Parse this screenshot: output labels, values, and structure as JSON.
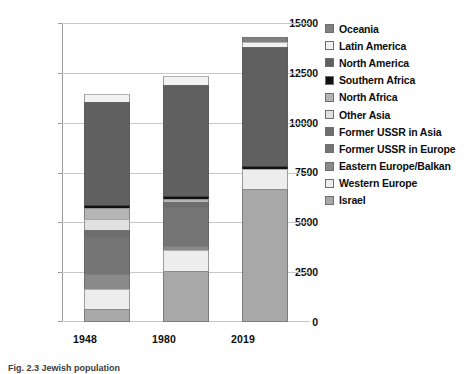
{
  "chart_data": {
    "type": "bar",
    "subtype": "stacked-vertical",
    "title": "",
    "xlabel": "",
    "ylabel": "",
    "categories": [
      "1948",
      "1980",
      "2019"
    ],
    "ylim": [
      0,
      15000
    ],
    "yticks": [
      0,
      2500,
      5000,
      7500,
      10000,
      12500,
      15000
    ],
    "ytick_labels": [
      "0",
      "2500",
      "5000",
      "7500",
      "10000",
      "12500",
      "15000"
    ],
    "grid": true,
    "legend_position": "right",
    "stack_order_bottom_to_top": [
      "Israel",
      "Western Europe",
      "Eastern Europe/Balkan",
      "Former USSR in Europe",
      "Former USSR in Asia",
      "Other Asia",
      "North Africa",
      "Southern Africa",
      "North America",
      "Latin America",
      "Oceania"
    ],
    "series": [
      {
        "name": "Oceania",
        "color": "#808080",
        "values": [
          0,
          0,
          250
        ]
      },
      {
        "name": "Latin America",
        "color": "#f2f2f2",
        "values": [
          400,
          450,
          250
        ]
      },
      {
        "name": "North America",
        "color": "#606060",
        "values": [
          5200,
          5600,
          6000
        ]
      },
      {
        "name": "Southern Africa",
        "color": "#111111",
        "values": [
          150,
          150,
          150
        ]
      },
      {
        "name": "North Africa",
        "color": "#b5b5b5",
        "values": [
          550,
          150,
          0
        ]
      },
      {
        "name": "Other Asia",
        "color": "#e0e0e0",
        "values": [
          550,
          0,
          0
        ]
      },
      {
        "name": "Former USSR in Asia",
        "color": "#6e6e6e",
        "values": [
          350,
          250,
          0
        ]
      },
      {
        "name": "Former USSR in Europe",
        "color": "#757575",
        "values": [
          1900,
          1950,
          0
        ]
      },
      {
        "name": "Eastern Europe/Balkan",
        "color": "#8a8a8a",
        "values": [
          750,
          200,
          0
        ]
      },
      {
        "name": "Western Europe",
        "color": "#ededed",
        "values": [
          1000,
          1100,
          1000
        ]
      },
      {
        "name": "Israel",
        "color": "#a8a8a8",
        "values": [
          650,
          2550,
          6700
        ]
      }
    ],
    "totals": [
      11500,
      12400,
      14350
    ]
  },
  "legend": {
    "items": [
      {
        "label": "Oceania",
        "color": "#808080"
      },
      {
        "label": "Latin America",
        "color": "#f2f2f2"
      },
      {
        "label": "North America",
        "color": "#606060"
      },
      {
        "label": "Southern Africa",
        "color": "#111111"
      },
      {
        "label": "North Africa",
        "color": "#b5b5b5"
      },
      {
        "label": "Other Asia",
        "color": "#e0e0e0"
      },
      {
        "label": "Former USSR in Asia",
        "color": "#6e6e6e"
      },
      {
        "label": "Former USSR in Europe",
        "color": "#757575"
      },
      {
        "label": "Eastern Europe/Balkan",
        "color": "#8a8a8a"
      },
      {
        "label": "Western Europe",
        "color": "#ededed"
      },
      {
        "label": "Israel",
        "color": "#a8a8a8"
      }
    ]
  },
  "caption": {
    "text": "Fig. 2.3 Jewish population"
  },
  "colors": {
    "gridline": "#c8c8c8",
    "axis": "#9a9a9a",
    "text": "#0d0d0d",
    "background": "#ffffff"
  }
}
